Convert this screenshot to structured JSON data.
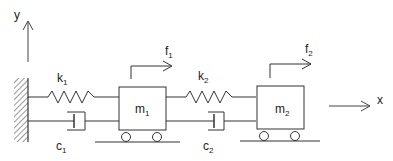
{
  "diagram": {
    "axes": {
      "y_label": "y",
      "x_label": "x"
    },
    "masses": [
      {
        "id": "m1",
        "label": "m",
        "sub": "1"
      },
      {
        "id": "m2",
        "label": "m",
        "sub": "2"
      }
    ],
    "springs": [
      {
        "id": "k1",
        "label": "k",
        "sub": "1"
      },
      {
        "id": "k2",
        "label": "k",
        "sub": "2"
      }
    ],
    "dampers": [
      {
        "id": "c1",
        "label": "c",
        "sub": "1"
      },
      {
        "id": "c2",
        "label": "c",
        "sub": "2"
      }
    ],
    "forces": [
      {
        "id": "f1",
        "label": "f",
        "sub": "1"
      },
      {
        "id": "f2",
        "label": "f",
        "sub": "2"
      }
    ],
    "colors": {
      "stroke": "#333333",
      "background": "#ffffff"
    }
  }
}
